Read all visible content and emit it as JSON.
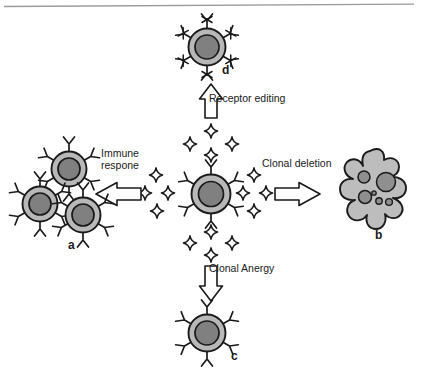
{
  "figure": {
    "type": "biological-schematic",
    "top_rule": true,
    "background_color": "#ffffff"
  },
  "palette": {
    "outline": "#1a1a1a",
    "cytoplasm": "#b8b8b8",
    "nucleus": "#808080",
    "apoptotic_body": "#bdbdbd",
    "vesicle": "#888888",
    "antigen_fill": "#ffffff",
    "text": "#1a1a1a"
  },
  "center": {
    "name": "immature-b-cell",
    "label": "",
    "receptor_count": 6,
    "antigen_count": 16
  },
  "pathways": [
    {
      "id": "immune-response",
      "label": "Immune respone",
      "direction": "left",
      "target_panel": "a"
    },
    {
      "id": "clonal-deletion",
      "label": "Clonal deletion",
      "direction": "right",
      "target_panel": "b"
    },
    {
      "id": "clonal-anergy",
      "label": "Clonal Anergy",
      "direction": "down",
      "target_panel": "c"
    },
    {
      "id": "receptor-editing",
      "label": "Receptor editing",
      "direction": "up",
      "target_panel": "d"
    }
  ],
  "panels": [
    {
      "letter": "a",
      "name": "proliferating-clone",
      "description": "cluster of three activated B cells",
      "cell_count": 3
    },
    {
      "letter": "b",
      "name": "apoptotic-cell",
      "description": "blebbing apoptotic cell with vesicles",
      "vesicle_count": 6
    },
    {
      "letter": "c",
      "name": "anergic-b-cell",
      "description": "single unresponsive B cell",
      "receptor_count": 6
    },
    {
      "letter": "d",
      "name": "receptor-edited-b-cell",
      "description": "B cell with crossed-out receptors",
      "receptor_count": 6,
      "crossed_receptors": true
    }
  ]
}
